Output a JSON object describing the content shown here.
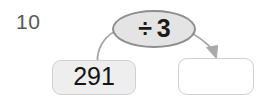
{
  "worksheet": {
    "question_number": "10",
    "background_color": "#ffffff"
  },
  "machine": {
    "operation": {
      "label": "÷ 3",
      "operator_symbol": "÷",
      "operand": "3",
      "shape": "ellipse",
      "fill_color": "#e4e4e4",
      "border_color": "#8d8d8d",
      "text_color": "#1b1b1b"
    },
    "input": {
      "value": "291",
      "fill_color": "#eeeeee",
      "border_color": "#cfcfcf",
      "text_color": "#141414"
    },
    "output": {
      "value": "",
      "placeholder": "",
      "fill_color": "#ffffff",
      "border_color": "#d0d0d0"
    },
    "connectors": {
      "input_to_operation": "curve-up-right",
      "operation_to_output": "curve-down-right-arrow",
      "stroke_color": "#a8a8a8",
      "arrowhead_color": "#a8a8a8"
    }
  },
  "icons": {
    "arrow_down_right": "arrow-down-right-icon",
    "divide": "divide-icon"
  }
}
